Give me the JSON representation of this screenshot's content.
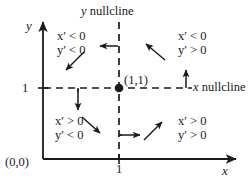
{
  "figure": {
    "type": "phase-plane-nullcline-diagram",
    "axes": {
      "x_axis_label": "x",
      "y_axis_label": "y",
      "origin_label": "(0,0)",
      "x_tick_label": "1",
      "y_tick_label": "1"
    },
    "nullclines": {
      "vertical_label": "y nullcline",
      "vertical_label_var": "y",
      "vertical_label_text": "nullcline",
      "horizontal_label": "x nullcline",
      "horizontal_label_var": "x",
      "horizontal_label_text": "nullcline"
    },
    "equilibrium": {
      "label": "(1,1)",
      "x": 1,
      "y": 1
    },
    "quadrants": [
      {
        "name": "upper-left",
        "x_sign": "x' < 0",
        "y_sign": "y' < 0",
        "x_prime": "x′ < 0",
        "y_prime": "y′ < 0",
        "arrow_direction": "southwest"
      },
      {
        "name": "upper-right",
        "x_sign": "x' < 0",
        "y_sign": "y' > 0",
        "x_prime": "x′ < 0",
        "y_prime": "y′ > 0",
        "arrow_direction": "northwest"
      },
      {
        "name": "lower-left",
        "x_sign": "x' > 0",
        "y_sign": "y' < 0",
        "x_prime": "x′ > 0",
        "y_prime": "y′ < 0",
        "arrow_direction": "southeast"
      },
      {
        "name": "lower-right",
        "x_sign": "x' > 0",
        "y_sign": "y' > 0",
        "x_prime": "x′ > 0",
        "y_prime": "y′ > 0",
        "arrow_direction": "northeast"
      }
    ],
    "boundary_arrows": [
      {
        "name": "left-arrow-on-y-nullcline-upper",
        "direction": "left"
      },
      {
        "name": "up-arrow-on-x-nullcline-right",
        "direction": "up"
      },
      {
        "name": "down-arrow-on-y-nullcline-lower",
        "direction": "down"
      },
      {
        "name": "right-arrow-on-x-nullcline-left",
        "direction": "right"
      }
    ],
    "colors": {
      "ink": "#1a1a1a",
      "background": "#ffffff"
    }
  }
}
